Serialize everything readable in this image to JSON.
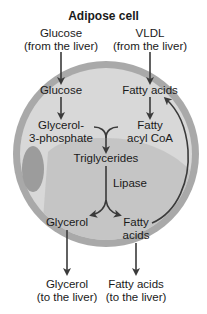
{
  "title": "Adipose cell",
  "colors": {
    "background": "#ffffff",
    "membrane": "#a9a9a9",
    "cytoplasm": "#d6d6d6",
    "lipid_droplet": "#bcbcbc",
    "nucleus": "#9a9a9a",
    "arrow": "#3a3a3a",
    "text": "#1a1a1a"
  },
  "inputs": {
    "glucose": {
      "line1": "Glucose",
      "line2": "(from the liver)"
    },
    "vldl": {
      "line1": "VLDL",
      "line2": "(from the liver)"
    }
  },
  "cell": {
    "glucose": "Glucose",
    "fatty_acids_top": "Fatty acids",
    "glycerol_3_phosphate": {
      "line1": "Glycerol-",
      "line2": "3-phosphate"
    },
    "fatty_acyl_coa": {
      "line1": "Fatty",
      "line2": "acyl CoA"
    },
    "triglycerides": "Triglycerides",
    "lipase": "Lipase",
    "glycerol": "Glycerol",
    "fatty_acids_bottom": {
      "line1": "Fatty",
      "line2": "acids"
    }
  },
  "outputs": {
    "glycerol": {
      "line1": "Glycerol",
      "line2": "(to the liver)"
    },
    "fatty_acids": {
      "line1": "Fatty acids",
      "line2": "(to the liver)"
    }
  },
  "structure": {
    "nodes": [
      "Glucose (from the liver)",
      "VLDL (from the liver)",
      "Glucose",
      "Fatty acids",
      "Glycerol-3-phosphate",
      "Fatty acyl CoA",
      "Triglycerides",
      "Glycerol",
      "Fatty acids (bottom)",
      "Glycerol (to the liver)",
      "Fatty acids (to the liver)"
    ],
    "edges": [
      [
        "Glucose (from the liver)",
        "Glucose"
      ],
      [
        "VLDL (from the liver)",
        "Fatty acids"
      ],
      [
        "Glucose",
        "Glycerol-3-phosphate"
      ],
      [
        "Fatty acids",
        "Fatty acyl CoA"
      ],
      [
        "Glycerol-3-phosphate",
        "Triglycerides"
      ],
      [
        "Fatty acyl CoA",
        "Triglycerides"
      ],
      [
        "Triglycerides",
        "Glycerol",
        "Lipase"
      ],
      [
        "Triglycerides",
        "Fatty acids (bottom)",
        "Lipase"
      ],
      [
        "Fatty acids (bottom)",
        "Fatty acids"
      ],
      [
        "Glycerol",
        "Glycerol (to the liver)"
      ],
      [
        "Fatty acids (bottom)",
        "Fatty acids (to the liver)"
      ]
    ]
  }
}
